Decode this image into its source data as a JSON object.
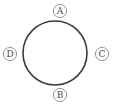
{
  "figure": {
    "type": "geometric-diagram",
    "background_color": "#ffffff",
    "main_circle": {
      "name": "main-circle",
      "center_x": 55,
      "center_y": 53,
      "radius": 32,
      "stroke_color": "#3c3c3c",
      "stroke_width": 1.6,
      "fill": "none"
    },
    "label_style": {
      "circle_radius": 6.6,
      "circle_stroke_color": "#8a8a8a",
      "circle_stroke_width": 0.9,
      "circle_fill": "#ffffff",
      "text_color": "#4a4a4a",
      "font_size": 9
    },
    "labels": [
      {
        "id": "label-a",
        "text": "A",
        "position": "top",
        "cx": 60,
        "cy": 11
      },
      {
        "id": "label-b",
        "text": "B",
        "position": "bottom",
        "cx": 60,
        "cy": 95
      },
      {
        "id": "label-c",
        "text": "C",
        "position": "right",
        "cx": 102,
        "cy": 54
      },
      {
        "id": "label-d",
        "text": "D",
        "position": "left",
        "cx": 10,
        "cy": 54
      }
    ]
  }
}
